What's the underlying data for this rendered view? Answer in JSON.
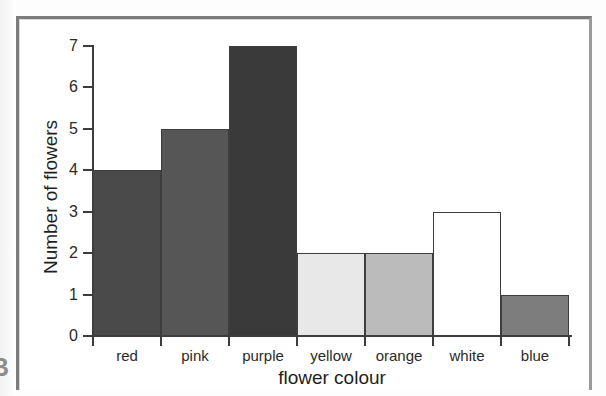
{
  "figure": {
    "side_marker": "B"
  },
  "chart_data": {
    "type": "bar",
    "title": "",
    "xlabel": "flower colour",
    "ylabel": "Number of flowers",
    "categories": [
      "red",
      "pink",
      "purple",
      "yellow",
      "orange",
      "white",
      "blue"
    ],
    "values": [
      4,
      5,
      7,
      2,
      2,
      3,
      1
    ],
    "bar_colors": [
      "#4a4a4a",
      "#565656",
      "#3a3a3a",
      "#e8e8e8",
      "#bbbbbb",
      "#ffffff",
      "#7d7d7d"
    ],
    "bar_border_color": "#3d3d3d",
    "ylim": [
      0,
      7
    ],
    "ytick_labels": [
      "0",
      "1",
      "2",
      "3",
      "4",
      "5",
      "6",
      "7"
    ],
    "ytick_values": [
      0,
      1,
      2,
      3,
      4,
      5,
      6,
      7
    ],
    "grid": false,
    "legend": "none",
    "bars_adjacent": true
  }
}
